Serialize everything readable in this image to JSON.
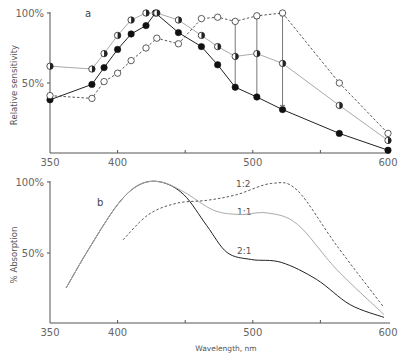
{
  "chart_data": [
    {
      "panel": "a",
      "type": "line",
      "title": "",
      "xlabel": "",
      "ylabel": "Relative sensitivity",
      "xlim": [
        350,
        600
      ],
      "ylim": [
        0,
        100
      ],
      "x_ticks": [
        350,
        400,
        450,
        500,
        550,
        600
      ],
      "x_tick_labels": [
        "350",
        "400",
        "",
        "500",
        "",
        "600"
      ],
      "y_tick_labels": [
        "50%",
        "100%"
      ],
      "grid": false,
      "series": [
        {
          "name": "filled circles",
          "marker": "filled",
          "line": "solid-dark",
          "x": [
            350,
            381,
            390,
            400,
            410,
            421,
            428,
            445,
            462,
            474,
            487,
            503,
            522,
            564,
            600
          ],
          "y": [
            38,
            49,
            61,
            74,
            85,
            91,
            100,
            86,
            76,
            63,
            47,
            40,
            31,
            14,
            2
          ]
        },
        {
          "name": "half-filled circles",
          "marker": "half",
          "line": "solid-light",
          "x": [
            350,
            381,
            390,
            400,
            410,
            421,
            429,
            445,
            462,
            474,
            487,
            503,
            522,
            564,
            600
          ],
          "y": [
            62,
            60,
            71,
            84,
            95,
            100,
            100,
            95,
            84,
            76,
            69,
            71,
            64,
            34,
            9
          ]
        },
        {
          "name": "open circles",
          "marker": "open",
          "line": "dashed",
          "x": [
            350,
            381,
            390,
            400,
            410,
            421,
            429,
            445,
            462,
            474,
            487,
            503,
            522,
            564,
            600
          ],
          "y": [
            41,
            39,
            51,
            57,
            66,
            75,
            82,
            78,
            96,
            97,
            94,
            98,
            100,
            50,
            14
          ]
        }
      ],
      "error_bars": [
        {
          "x": 487,
          "y_low": 46,
          "y_high": 95
        },
        {
          "x": 503,
          "y_low": 40,
          "y_high": 96
        },
        {
          "x": 522,
          "y_low": 34,
          "y_high": 98
        }
      ]
    },
    {
      "panel": "b",
      "type": "line",
      "title": "",
      "xlabel": "Wavelength, nm",
      "ylabel": "% Absorption",
      "xlim": [
        350,
        600
      ],
      "ylim": [
        0,
        100
      ],
      "x_ticks": [
        350,
        400,
        450,
        500,
        550,
        600
      ],
      "x_tick_labels": [
        "350",
        "400",
        "",
        "500",
        "",
        "600"
      ],
      "y_tick_labels": [
        "50%",
        "100%"
      ],
      "grid": false,
      "series": [
        {
          "name": "2:1",
          "line": "solid-dark",
          "x": [
            362,
            379,
            400,
            416,
            432,
            449,
            466,
            481,
            499,
            521,
            547,
            572,
            597
          ],
          "y": [
            25,
            53,
            84,
            98,
            100,
            91,
            69,
            50,
            45,
            43,
            31,
            13,
            4
          ]
        },
        {
          "name": "1:1",
          "line": "solid-light",
          "x": [
            362,
            379,
            400,
            416,
            432,
            449,
            471,
            490,
            511,
            533,
            562,
            597
          ],
          "y": [
            25,
            53,
            84,
            98,
            100,
            93,
            80,
            77,
            78,
            70,
            38,
            6
          ]
        },
        {
          "name": "1:2",
          "line": "dashed",
          "x": [
            404,
            423,
            444,
            466,
            488,
            514,
            533,
            562,
            597
          ],
          "y": [
            59,
            77,
            85,
            87,
            91,
            99,
            94,
            55,
            11
          ]
        }
      ]
    }
  ],
  "labels": {
    "panel_a": "a",
    "panel_b": "b",
    "ylabel_top": "Relative sensitivity",
    "ylabel_bottom": "% Absorption",
    "xlabel": "Wavelength, nm",
    "y100": "100%",
    "y50": "50%",
    "x350": "350",
    "x400": "400",
    "x500": "500",
    "x600": "600",
    "curve_12": "1:2",
    "curve_11": "1:1",
    "curve_21": "2:1"
  }
}
